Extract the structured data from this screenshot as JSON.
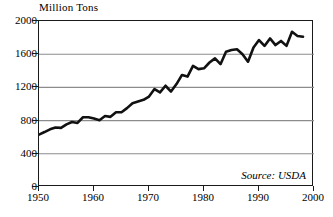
{
  "chart_data": {
    "type": "line",
    "title": "",
    "ylabel": "Million Tons",
    "xlabel": "",
    "ylim": [
      0,
      2000
    ],
    "xlim": [
      1950,
      2000
    ],
    "grid": "horizontal",
    "legend": "none",
    "yticks": [
      0,
      400,
      800,
      1200,
      1600,
      2000
    ],
    "ytick_labels": [
      "0",
      "400",
      "800",
      "1200",
      "1600",
      "2000"
    ],
    "xticks": [
      1950,
      1960,
      1970,
      1980,
      1990,
      2000
    ],
    "xtick_labels": [
      "1950",
      "1960",
      "1970",
      "1980",
      "1990",
      "2000"
    ],
    "annotation": "Source: USDA",
    "line_color": "#111111",
    "grid_color": "#8c8c8c",
    "axis_color": "#1a1a1a",
    "series": [
      {
        "name": "World Grain Production",
        "x": [
          1950,
          1951,
          1952,
          1953,
          1954,
          1955,
          1956,
          1957,
          1958,
          1959,
          1960,
          1961,
          1962,
          1963,
          1964,
          1965,
          1966,
          1967,
          1968,
          1969,
          1970,
          1971,
          1972,
          1973,
          1974,
          1975,
          1976,
          1977,
          1978,
          1979,
          1980,
          1981,
          1982,
          1983,
          1984,
          1985,
          1986,
          1987,
          1988,
          1989,
          1990,
          1991,
          1992,
          1993,
          1994,
          1995,
          1996,
          1997,
          1998
        ],
        "values": [
          631,
          662,
          695,
          717,
          712,
          755,
          783,
          772,
          840,
          840,
          824,
          805,
          855,
          845,
          900,
          900,
          950,
          1010,
          1030,
          1050,
          1090,
          1180,
          1140,
          1220,
          1150,
          1240,
          1350,
          1330,
          1460,
          1420,
          1430,
          1500,
          1550,
          1480,
          1630,
          1650,
          1660,
          1600,
          1510,
          1680,
          1770,
          1700,
          1790,
          1710,
          1760,
          1700,
          1870,
          1820,
          1810
        ]
      }
    ]
  }
}
